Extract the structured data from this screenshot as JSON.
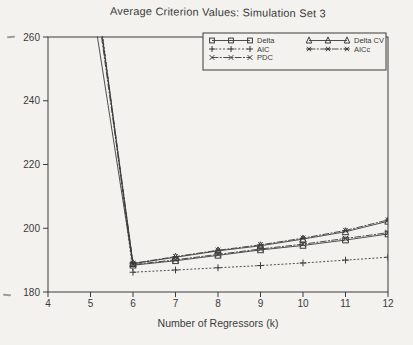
{
  "style": {
    "paper": "#f3f2ee",
    "ink": "#3b3b3b"
  },
  "chart_data": {
    "type": "line",
    "title": "Average Criterion Values: Simulation Set 3",
    "xlabel": "Number of Regressors (k)",
    "ylabel": "",
    "xlim": [
      4,
      12
    ],
    "ylim": [
      180,
      260
    ],
    "x_ticks": [
      4,
      5,
      6,
      7,
      8,
      9,
      10,
      11,
      12
    ],
    "y_ticks": [
      180,
      200,
      220,
      240,
      260
    ],
    "grid": false,
    "legend_position": "top-right-inside",
    "clip_to_axes": true,
    "x": [
      5,
      6,
      7,
      8,
      9,
      10,
      11,
      12
    ],
    "series": [
      {
        "name": "Delta",
        "marker": "square",
        "line": "solid",
        "values": [
          274,
          188.4,
          189.8,
          191.5,
          193.2,
          194.6,
          196.3,
          198.2
        ]
      },
      {
        "name": "AIC",
        "marker": "plus",
        "line": "dotted",
        "values": [
          290,
          186.2,
          186.9,
          187.6,
          188.3,
          189.1,
          190.0,
          190.9
        ]
      },
      {
        "name": "PDC",
        "marker": "x",
        "line": "dashdot",
        "values": [
          285,
          188.6,
          190.1,
          191.8,
          193.5,
          195.0,
          196.8,
          198.6
        ]
      },
      {
        "name": "Delta CV",
        "marker": "triangle",
        "line": "solid",
        "values": [
          287,
          188.9,
          190.9,
          192.9,
          194.5,
          196.6,
          198.9,
          202.2
        ]
      },
      {
        "name": "AICc",
        "marker": "asterisk",
        "line": "dashdot",
        "values": [
          288,
          189.0,
          191.1,
          193.1,
          194.8,
          196.9,
          199.3,
          202.6
        ]
      }
    ],
    "legend_columns": [
      [
        "Delta",
        "AIC",
        "PDC"
      ],
      [
        "Delta CV",
        "AICc"
      ]
    ]
  }
}
